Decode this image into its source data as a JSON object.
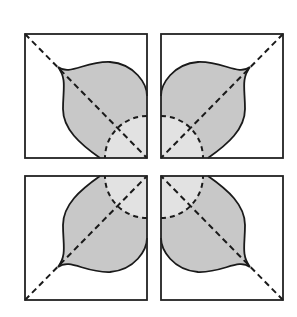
{
  "diagram": {
    "colors": {
      "background": "#ffffff",
      "frame": "#222222",
      "leaf_fill": "#c8c8c8",
      "inner_fill": "#e2e2e2",
      "stroke": "#1a1a1a"
    },
    "panels": [
      {
        "id": "top-left",
        "x": 25,
        "y": 34,
        "w": 122,
        "h": 124,
        "rotation": 0
      },
      {
        "id": "top-right",
        "x": 162,
        "y": 34,
        "w": 121,
        "h": 124,
        "rotation": 90
      },
      {
        "id": "bottom-left",
        "x": 25,
        "y": 176,
        "w": 122,
        "h": 124,
        "rotation": 270
      },
      {
        "id": "bottom-right",
        "x": 162,
        "y": 176,
        "w": 121,
        "h": 124,
        "rotation": 180
      }
    ]
  }
}
